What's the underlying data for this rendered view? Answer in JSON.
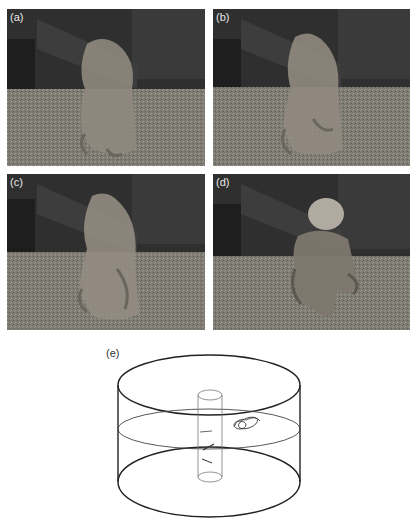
{
  "figure": {
    "panels": [
      {
        "id": "a",
        "label": "(a)",
        "pose": "octopus standing upright, arms spread at base"
      },
      {
        "id": "b",
        "label": "(b)",
        "pose": "octopus upright, arms curved outward"
      },
      {
        "id": "c",
        "label": "(c)",
        "pose": "octopus upright, arms arched in walking posture"
      },
      {
        "id": "d",
        "label": "(d)",
        "pose": "octopus walking away, mantle visible"
      }
    ],
    "diagram": {
      "label": "(e)",
      "description": "cylindrical tank with central column, horizontal plane, and octopus trajectory marks"
    }
  },
  "colors": {
    "background": "#ffffff",
    "photo_dark": "#2e2e2e",
    "gravel": "#8a8a80",
    "line": "#222222"
  }
}
